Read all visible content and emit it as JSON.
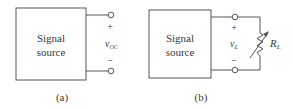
{
  "figure": {
    "panels": [
      {
        "id": "a",
        "caption": "(a)",
        "block": {
          "line1": "Signal",
          "line2": "source"
        },
        "terminals": {
          "plus": "+",
          "minus": "−"
        },
        "voltage": {
          "symbol": "v",
          "subscript": "OC"
        }
      },
      {
        "id": "b",
        "caption": "(b)",
        "block": {
          "line1": "Signal",
          "line2": "source"
        },
        "terminals": {
          "plus": "+",
          "minus": "−"
        },
        "voltage": {
          "symbol": "v",
          "subscript": "L"
        },
        "load": {
          "symbol": "R",
          "subscript": "L",
          "type": "variable-resistor"
        }
      }
    ],
    "colors": {
      "line": "#555555",
      "text": "#3a3a3a",
      "background": "#ffffff"
    }
  }
}
